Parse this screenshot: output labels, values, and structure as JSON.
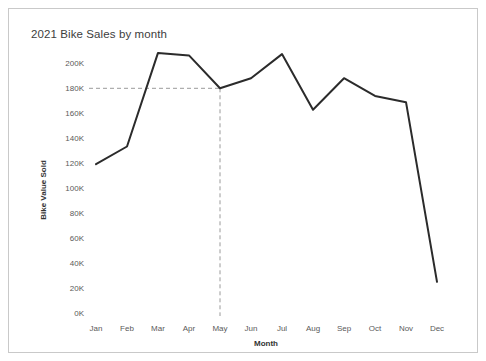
{
  "card": {
    "title": "2021 Bike Sales by month"
  },
  "chart_data": {
    "type": "line",
    "title": "2021 Bike Sales by month",
    "xlabel": "Month",
    "ylabel": "Bike Value Sold",
    "categories": [
      "Jan",
      "Feb",
      "Mar",
      "Apr",
      "May",
      "Jun",
      "Jul",
      "Aug",
      "Sep",
      "Oct",
      "Nov",
      "Dec"
    ],
    "values": [
      120000,
      134000,
      208000,
      206000,
      180000,
      188000,
      207000,
      163000,
      188000,
      174000,
      169000,
      27000
    ],
    "series": [
      {
        "name": "Bike Value Sold",
        "values": [
          120000,
          134000,
          208000,
          206000,
          180000,
          188000,
          207000,
          163000,
          188000,
          174000,
          169000,
          27000
        ]
      }
    ],
    "ylim": [
      0,
      210000
    ],
    "ytick_values": [
      0,
      20000,
      40000,
      60000,
      80000,
      100000,
      120000,
      140000,
      160000,
      180000,
      200000
    ],
    "ytick_labels": [
      "0K",
      "20K",
      "40K",
      "60K",
      "80K",
      "100K",
      "120K",
      "140K",
      "160K",
      "180K",
      "200K"
    ],
    "xtick_labels": [
      "Jan",
      "Feb",
      "Mar",
      "Apr",
      "May",
      "Jun",
      "Jul",
      "Aug",
      "Sep",
      "Oct",
      "Nov",
      "Dec"
    ],
    "grid": false,
    "legend": "none",
    "line_color": "#2b2b2b",
    "annotations": [
      {
        "type": "reference-lines",
        "label": "May at 180K",
        "x_category": "May",
        "y_value": 180000,
        "color": "#9a9a9a",
        "style": "dashed"
      }
    ]
  },
  "axis_labels": {
    "y0": "0K",
    "y1": "20K",
    "y2": "40K",
    "y3": "60K",
    "y4": "80K",
    "y5": "100K",
    "y6": "120K",
    "y7": "140K",
    "y8": "160K",
    "y9": "180K",
    "y10": "200K",
    "x0": "Jan",
    "x1": "Feb",
    "x2": "Mar",
    "x3": "Apr",
    "x4": "May",
    "x5": "Jun",
    "x6": "Jul",
    "x7": "Aug",
    "x8": "Sep",
    "x9": "Oct",
    "x10": "Nov",
    "x11": "Dec",
    "x_axis_title": "Month",
    "y_axis_title": "Bike Value Sold"
  }
}
